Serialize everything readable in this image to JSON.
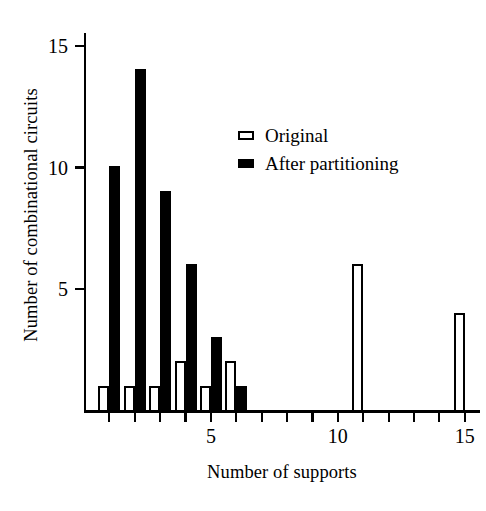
{
  "chart_data": {
    "type": "bar",
    "title": "",
    "subtitle": "",
    "xlabel": "Number of supports",
    "ylabel": "Number of combinational circuits",
    "x": [
      1,
      2,
      3,
      4,
      5,
      6,
      7,
      8,
      9,
      10,
      11,
      12,
      13,
      14,
      15
    ],
    "categories": [
      "1",
      "2",
      "3",
      "4",
      "5",
      "6",
      "7",
      "8",
      "9",
      "10",
      "11",
      "12",
      "13",
      "14",
      "15"
    ],
    "series": [
      {
        "name": "Original",
        "style": "hollow",
        "color": "#ffffff",
        "edge_color": "#000000",
        "values": [
          1,
          1,
          1,
          2,
          1,
          2,
          0,
          0,
          0,
          0,
          6,
          0,
          0,
          0,
          4
        ]
      },
      {
        "name": "After partitioning",
        "style": "filled",
        "color": "#000000",
        "edge_color": "#000000",
        "values": [
          10,
          14,
          9,
          6,
          3,
          1,
          0,
          0,
          0,
          0,
          0,
          0,
          0,
          0,
          0
        ]
      }
    ],
    "xlim": [
      0,
      15.6
    ],
    "ylim": [
      0,
      15.6
    ],
    "xticks": [
      1,
      2,
      3,
      4,
      5,
      6,
      7,
      8,
      9,
      10,
      11,
      12,
      13,
      14,
      15
    ],
    "xtick_labels_shown": [
      "5",
      "10",
      "15"
    ],
    "yticks": [
      5,
      10,
      15
    ],
    "ytick_labels": [
      "5",
      "10",
      "15"
    ],
    "grid": false,
    "legend_position": "upper center-right"
  },
  "axes": {
    "y_title": "Number of combinational circuits",
    "x_title": "Number of supports",
    "y_tick_labels": [
      "5",
      "10",
      "15"
    ],
    "x_tick_labels": [
      "5",
      "10",
      "15"
    ]
  },
  "legend": {
    "items": [
      {
        "label": "Original",
        "swatch": "hollow-square-icon"
      },
      {
        "label": "After partitioning",
        "swatch": "filled-square-icon"
      }
    ]
  }
}
